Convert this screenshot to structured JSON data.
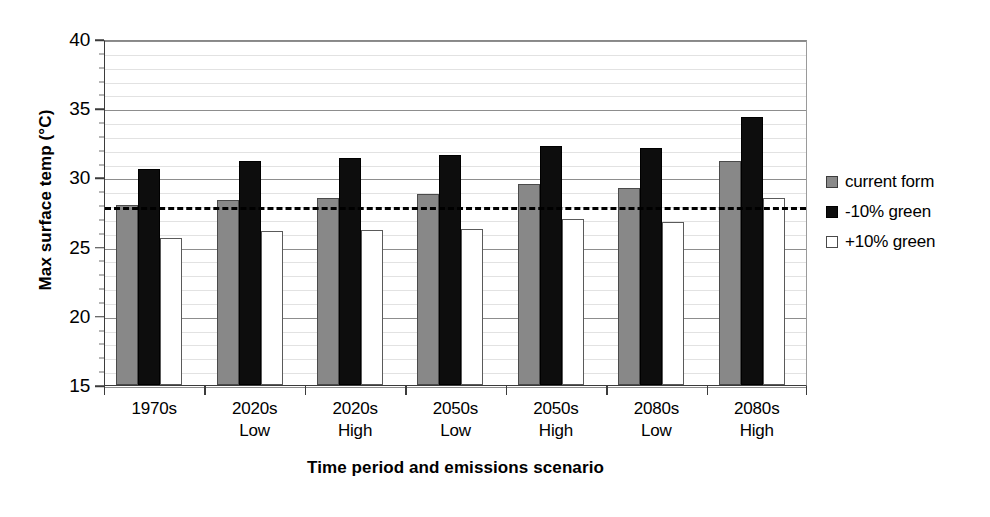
{
  "chart_data": {
    "type": "bar",
    "title": "",
    "xlabel": "Time period and emissions scenario",
    "ylabel": "Max surface temp (°C)",
    "ylim": [
      15,
      40
    ],
    "y_major_ticks": [
      15,
      20,
      25,
      30,
      35,
      40
    ],
    "y_major_tick_labels": [
      "15",
      "20",
      "25",
      "30",
      "35",
      "40"
    ],
    "y_minor_tick_step": 1,
    "grid": true,
    "legend_position": "right",
    "categories": [
      {
        "line1": "1970s",
        "line2": ""
      },
      {
        "line1": "2020s",
        "line2": "Low"
      },
      {
        "line1": "2020s",
        "line2": "High"
      },
      {
        "line1": "2050s",
        "line2": "Low"
      },
      {
        "line1": "2050s",
        "line2": "High"
      },
      {
        "line1": "2080s",
        "line2": "Low"
      },
      {
        "line1": "2080s",
        "line2": "High"
      }
    ],
    "series": [
      {
        "name": "current form",
        "key": "current",
        "color": "#888888",
        "values": [
          28.0,
          28.4,
          28.5,
          28.8,
          29.5,
          29.2,
          31.2
        ]
      },
      {
        "name": "-10% green",
        "key": "minus",
        "color": "#0d0d0d",
        "values": [
          30.6,
          31.2,
          31.4,
          31.6,
          32.3,
          32.1,
          34.4
        ]
      },
      {
        "name": "+10% green",
        "key": "plus",
        "color": "#ffffff",
        "values": [
          25.6,
          26.1,
          26.2,
          26.3,
          27.0,
          26.8,
          28.5
        ]
      }
    ],
    "annotations": [
      {
        "name": "threshold-line",
        "type": "horizontal-dashed-line",
        "value": 28.0
      }
    ]
  },
  "legend": {
    "items": [
      {
        "label": "current form",
        "key": "current"
      },
      {
        "label": "-10% green",
        "key": "minus"
      },
      {
        "label": "+10% green",
        "key": "plus"
      }
    ]
  }
}
